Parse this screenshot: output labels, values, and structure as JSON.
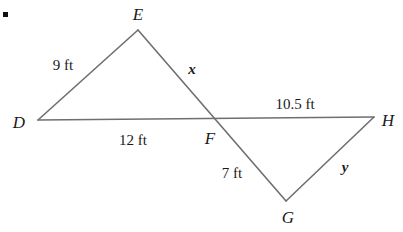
{
  "figure": {
    "type": "geometry-diagram",
    "width": 403,
    "height": 232,
    "background_color": "#ffffff",
    "stroke_color": "#6f6f72",
    "text_color": "#1a1a1a",
    "bullet": {
      "name": "list-bullet",
      "x": 3,
      "y": 12,
      "size": 5,
      "color": "#111111"
    },
    "points": {
      "D": {
        "label": "D",
        "x": 38,
        "y": 120
      },
      "E": {
        "label": "E",
        "x": 138,
        "y": 30
      },
      "F": {
        "label": "F",
        "x": 218,
        "y": 118
      },
      "G": {
        "label": "G",
        "x": 286,
        "y": 201
      },
      "H": {
        "label": "H",
        "x": 374,
        "y": 117
      }
    },
    "vertex_labels": [
      {
        "id": "E",
        "text": "E",
        "x": 138,
        "y": 14
      },
      {
        "id": "D",
        "text": "D",
        "x": 19,
        "y": 122
      },
      {
        "id": "F",
        "text": "F",
        "x": 210,
        "y": 138
      },
      {
        "id": "H",
        "text": "H",
        "x": 388,
        "y": 120
      },
      {
        "id": "G",
        "text": "G",
        "x": 288,
        "y": 217
      }
    ],
    "segments": [
      {
        "id": "DH",
        "from": "D",
        "to": "H",
        "description": "horizontal-base-line-D-through-F-to-H"
      },
      {
        "id": "DE",
        "from": "D",
        "to": "E",
        "description": "left-triangle-upper-left-side"
      },
      {
        "id": "EG",
        "from": "E",
        "to": "G",
        "description": "transversal-E-through-F-to-G"
      },
      {
        "id": "GH",
        "from": "G",
        "to": "H",
        "description": "right-triangle-lower-right-side"
      }
    ],
    "measurements": [
      {
        "id": "DE",
        "text": "9 ft",
        "style": "measure",
        "x": 63,
        "y": 65
      },
      {
        "id": "EF",
        "text": "x",
        "style": "variable",
        "x": 192,
        "y": 69
      },
      {
        "id": "DF",
        "text": "12 ft",
        "style": "measure",
        "x": 133,
        "y": 140
      },
      {
        "id": "FH",
        "text": "10.5 ft",
        "style": "measure",
        "x": 295,
        "y": 104
      },
      {
        "id": "FG",
        "text": "7 ft",
        "style": "measure",
        "x": 232,
        "y": 173
      },
      {
        "id": "GH",
        "text": "y",
        "style": "variable",
        "x": 345,
        "y": 167
      }
    ]
  },
  "chart_data": {
    "type": "diagram",
    "title": "",
    "shapes": [
      {
        "name": "triangle-DEF",
        "vertices": [
          "D",
          "E",
          "F"
        ],
        "sides": [
          {
            "between": [
              "D",
              "E"
            ],
            "length": 9,
            "unit": "ft",
            "label": "9 ft"
          },
          {
            "between": [
              "E",
              "F"
            ],
            "length": null,
            "unit": "ft",
            "label": "x"
          },
          {
            "between": [
              "D",
              "F"
            ],
            "length": 12,
            "unit": "ft",
            "label": "12 ft"
          }
        ]
      },
      {
        "name": "triangle-FGH",
        "vertices": [
          "F",
          "G",
          "H"
        ],
        "sides": [
          {
            "between": [
              "F",
              "G"
            ],
            "length": 7,
            "unit": "ft",
            "label": "7 ft"
          },
          {
            "between": [
              "F",
              "H"
            ],
            "length": 10.5,
            "unit": "ft",
            "label": "10.5 ft"
          },
          {
            "between": [
              "G",
              "H"
            ],
            "length": null,
            "unit": "ft",
            "label": "y"
          }
        ]
      }
    ],
    "unknowns": [
      "x",
      "y"
    ],
    "labels": [
      "D",
      "E",
      "F",
      "G",
      "H"
    ],
    "annotations": [
      "9 ft",
      "x",
      "12 ft",
      "10.5 ft",
      "7 ft",
      "y"
    ]
  }
}
